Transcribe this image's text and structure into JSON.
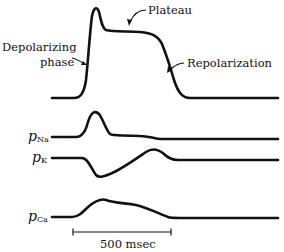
{
  "figure": {
    "annotations": {
      "depolarizing_line1": "Depolarizing",
      "depolarizing_line2": "phase",
      "plateau": "Plateau",
      "repolarization": "Repolarization"
    },
    "traces": [
      {
        "id": "action-potential",
        "label": ""
      },
      {
        "id": "pNa",
        "label_main": "p",
        "label_sub": "Na"
      },
      {
        "id": "pK",
        "label_main": "p",
        "label_sub": "K"
      },
      {
        "id": "pCa",
        "label_main": "p",
        "label_sub": "Ca"
      }
    ],
    "scale_bar": {
      "label": "500 msec"
    },
    "colors": {
      "stroke": "#111111",
      "background": "#ffffff"
    }
  }
}
